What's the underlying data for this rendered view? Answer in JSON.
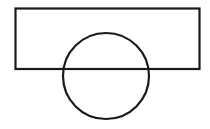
{
  "diagram": {
    "background": "#ffffff",
    "stroke": "#1a1a1a",
    "stroke_width": 2.2,
    "shapes": [
      {
        "type": "rectangle",
        "x": 15.5,
        "y": 8.5,
        "width": 184,
        "height": 60.5
      },
      {
        "type": "circle",
        "cx": 106,
        "cy": 76,
        "r": 43
      }
    ]
  }
}
